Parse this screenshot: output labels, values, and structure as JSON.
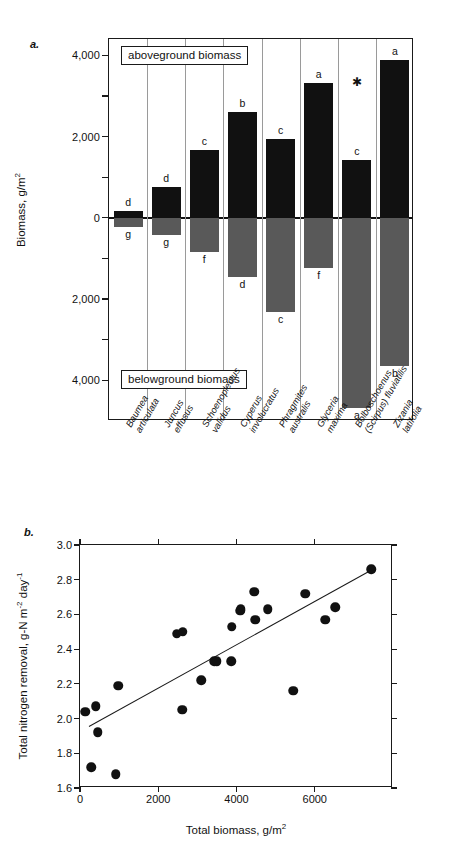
{
  "figure": {
    "panel_a_letter": "a.",
    "panel_b_letter": "b."
  },
  "panel_a": {
    "y_axis_label_main": "Biomass, g/m",
    "y_axis_label_exp": "2",
    "y_ticks": [
      "4,000",
      "",
      "2,000",
      "",
      "0",
      "",
      "2,000",
      "",
      "4,000"
    ],
    "y_tick_values": [
      4000,
      3000,
      2000,
      1000,
      0,
      -1000,
      -2000,
      -3000,
      -4000
    ],
    "box_label_top": "aboveground biomass",
    "box_label_bottom": "belowground biomass",
    "asterisk": "✱",
    "species": [
      {
        "name_line1": "Baumea",
        "name_line2": "articulata",
        "above": 170,
        "below": -230,
        "above_letter": "d",
        "below_letter": "g"
      },
      {
        "name_line1": "Juncus",
        "name_line2": "effusus",
        "above": 760,
        "below": -420,
        "above_letter": "d",
        "below_letter": "g"
      },
      {
        "name_line1": "Schoenoplectus",
        "name_line2": "validus",
        "above": 1660,
        "below": -830,
        "above_letter": "c",
        "below_letter": "f"
      },
      {
        "name_line1": "Cyperus",
        "name_line2": "involucratus",
        "above": 2610,
        "below": -1450,
        "above_letter": "b",
        "below_letter": "d"
      },
      {
        "name_line1": "Phragmites",
        "name_line2": "australis",
        "above": 1930,
        "below": -2330,
        "above_letter": "c",
        "below_letter": "c"
      },
      {
        "name_line1": "Glyceria",
        "name_line2": "maxima",
        "above": 3320,
        "below": -1230,
        "above_letter": "a",
        "below_letter": "f"
      },
      {
        "name_line1": "Bolboschoenus",
        "name_line2": "(Scirpus) fluviatilis",
        "above": 1430,
        "below": -4670,
        "above_letter": "c",
        "below_letter": "a"
      },
      {
        "name_line1": "Zizania",
        "name_line2": "latifolia",
        "above": 3880,
        "below": -3640,
        "above_letter": "a",
        "below_letter": "b"
      }
    ]
  },
  "chart_data": [
    {
      "type": "bar",
      "title": "",
      "xlabel": "",
      "ylabel": "Biomass, g/m2",
      "ylim": [
        -5000,
        4400
      ],
      "categories": [
        "Baumea articulata",
        "Juncus effusus",
        "Schoenoplectus validus",
        "Cyperus involucratus",
        "Phragmites australis",
        "Glyceria maxima",
        "Bolboschoenus (Scirpus) fluviatilis",
        "Zizania latifolia"
      ],
      "series": [
        {
          "name": "aboveground biomass",
          "values": [
            170,
            760,
            1660,
            2610,
            1930,
            3320,
            1430,
            3880
          ]
        },
        {
          "name": "belowground biomass",
          "values": [
            -230,
            -420,
            -830,
            -1450,
            -2330,
            -1230,
            -4670,
            -3640
          ]
        }
      ],
      "annotations": {
        "aboveground_groups": [
          "d",
          "d",
          "c",
          "b",
          "c",
          "a",
          "c",
          "a"
        ],
        "belowground_groups": [
          "g",
          "g",
          "f",
          "d",
          "c",
          "f",
          "a",
          "b"
        ]
      },
      "grid": false,
      "legend": "inline-boxed"
    },
    {
      "type": "scatter",
      "title": "",
      "xlabel": "Total biomass, g/m2",
      "ylabel": "Total nitrogen removal, g-N m-2 day-1",
      "xlim": [
        0,
        8000
      ],
      "ylim": [
        1.6,
        3.0
      ],
      "xticks": [
        0,
        2000,
        4000,
        6000
      ],
      "yticks": [
        1.6,
        1.8,
        2.0,
        2.2,
        2.4,
        2.6,
        2.8,
        3.0
      ],
      "grid": false,
      "x": [
        130,
        290,
        400,
        450,
        920,
        980,
        2470,
        2610,
        2620,
        3100,
        3430,
        3490,
        3870,
        3880,
        4100,
        4110,
        4450,
        4480,
        4800,
        5450,
        5760,
        6270,
        6520,
        7450
      ],
      "y": [
        2.04,
        1.72,
        2.07,
        1.92,
        1.68,
        2.19,
        2.49,
        2.05,
        2.5,
        2.22,
        2.33,
        2.33,
        2.33,
        2.53,
        2.62,
        2.63,
        2.73,
        2.57,
        2.63,
        2.16,
        2.72,
        2.57,
        2.64,
        2.86
      ],
      "fit_line": {
        "x0": 240,
        "y0": 1.955,
        "x1": 7450,
        "y1": 2.855
      }
    }
  ],
  "panel_b": {
    "y_axis_label_part1": "Total nitrogen removal, g-N m",
    "y_axis_label_exp1": "-2",
    "y_axis_label_part2": " day",
    "y_axis_label_exp2": "-1",
    "x_axis_label_main": "Total biomass, g/m",
    "x_axis_label_exp": "2",
    "y_ticks": [
      "1.6",
      "1.8",
      "2.0",
      "2.2",
      "2.4",
      "2.6",
      "2.8",
      "3.0"
    ],
    "x_ticks": [
      "0",
      "2000",
      "4000",
      "6000"
    ]
  }
}
